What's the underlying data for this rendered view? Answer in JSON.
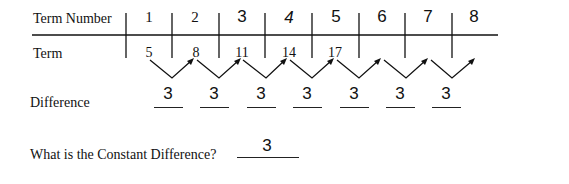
{
  "table": {
    "row_labels": {
      "term_number": "Term Number",
      "term": "Term"
    },
    "term_numbers": [
      "1",
      "2",
      "3",
      "4",
      "5",
      "6",
      "7",
      "8"
    ],
    "terms": [
      "5",
      "8",
      "11",
      "14",
      "17",
      "",
      "",
      ""
    ]
  },
  "difference": {
    "label": "Difference",
    "values": [
      "3",
      "3",
      "3",
      "3",
      "3",
      "3",
      "3"
    ]
  },
  "question": {
    "text": "What is the Constant Difference?",
    "answer": "3"
  }
}
